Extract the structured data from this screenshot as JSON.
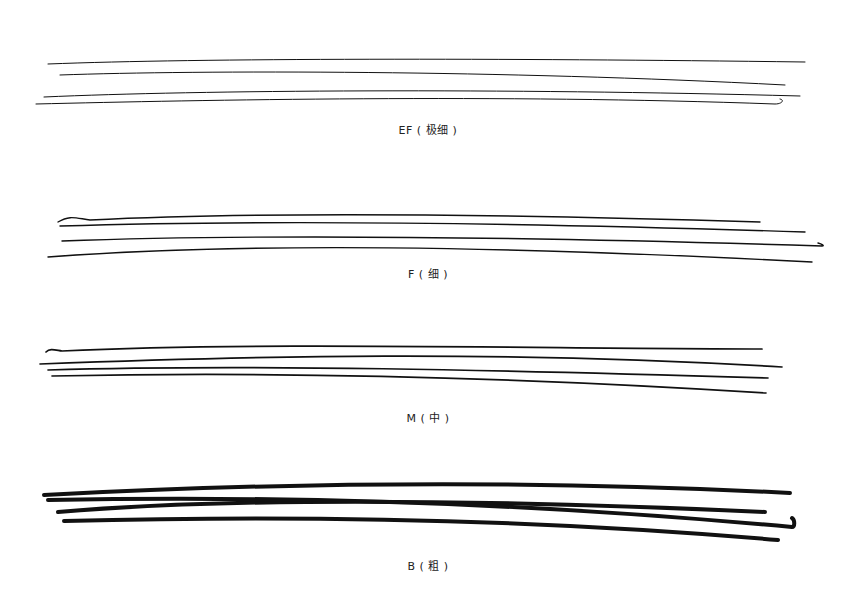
{
  "samples": [
    {
      "label": "EF ( 极细 )",
      "label_y": 121,
      "stroke_width": 1.0,
      "lines": [
        "M48,64 C200,58 500,58 805,62",
        "M60,75 C200,70 500,70 785,85",
        "M44,97 C200,90 500,88 800,96",
        "M36,104 C200,100 500,94 775,104 C782,104 785,100 780,99"
      ]
    },
    {
      "label": "F ( 细 )",
      "label_y": 265,
      "stroke_width": 1.4,
      "lines": [
        "M58,222 C70,215 75,218 90,220 C250,212 500,214 760,222",
        "M60,226 C250,220 500,222 805,232",
        "M62,241 C250,234 500,236 822,246 C825,246 822,244 818,243",
        "M48,257 C250,242 500,246 812,262"
      ]
    },
    {
      "label": "M ( 中 )",
      "label_y": 410,
      "stroke_width": 1.7,
      "lines": [
        "M46,352 C50,348 55,350 62,351 C250,342 500,348 762,349",
        "M40,364 C250,356 500,350 782,367",
        "M48,370 C250,364 500,370 768,378",
        "M52,376 C250,372 500,376 766,393"
      ]
    },
    {
      "label": "B ( 粗 )",
      "label_y": 558,
      "stroke_width": 4.0,
      "lines": [
        "M44,495 C250,484 500,478 790,493",
        "M58,512 C250,496 500,500 765,512",
        "M48,500 C250,496 500,500 792,527 C795,527 795,520 792,518",
        "M64,521 C250,516 500,516 778,540"
      ]
    }
  ],
  "colors": {
    "ink": "#111111",
    "label": "#222222",
    "paper": "#ffffff"
  }
}
